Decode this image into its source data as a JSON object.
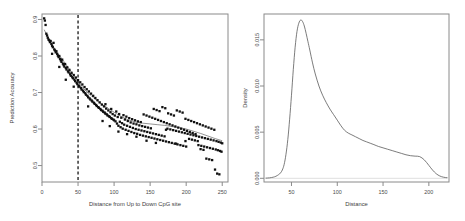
{
  "figure": {
    "panel_count": 2,
    "background": "#ffffff"
  },
  "chart_data": [
    {
      "type": "scatter",
      "title": "",
      "xlabel": "Distance from Up to Down CpG site",
      "ylabel": "Prediction Accuracy",
      "xlim": [
        0,
        258
      ],
      "ylim": [
        0.455,
        0.915
      ],
      "xticks": [
        0,
        50,
        100,
        150,
        200,
        250
      ],
      "xticklabels": [
        "0",
        "50",
        "100",
        "150",
        "200",
        "250"
      ],
      "yticks": [
        0.5,
        0.6,
        0.7,
        0.8,
        0.9
      ],
      "yticklabels": [
        "0.5",
        "0.6",
        "0.7",
        "0.8",
        "0.9"
      ],
      "grid": false,
      "legend": "none",
      "marker": "filled-square",
      "point_color": "#101010",
      "annotations": [
        {
          "name": "vertical-cutoff-line",
          "type": "vline",
          "x": 50,
          "style": "dashed",
          "color": "#000000"
        }
      ],
      "trend_line": {
        "name": "loess-trend",
        "color": "#2a2a2a",
        "x": [
          3,
          10,
          20,
          30,
          40,
          50,
          60,
          70,
          80,
          90,
          100,
          110,
          120,
          130,
          140,
          150,
          160,
          170,
          180,
          190,
          200,
          210,
          220,
          230,
          240,
          250
        ],
        "y": [
          0.872,
          0.845,
          0.812,
          0.786,
          0.758,
          0.729,
          0.706,
          0.688,
          0.672,
          0.659,
          0.646,
          0.634,
          0.625,
          0.619,
          0.616,
          0.614,
          0.612,
          0.61,
          0.607,
          0.604,
          0.6,
          0.594,
          0.588,
          0.581,
          0.574,
          0.568
        ]
      },
      "points": [
        [
          3,
          0.903
        ],
        [
          4,
          0.897
        ],
        [
          5,
          0.885
        ],
        [
          6,
          0.861
        ],
        [
          7,
          0.856
        ],
        [
          8,
          0.85
        ],
        [
          9,
          0.845
        ],
        [
          10,
          0.843
        ],
        [
          11,
          0.838
        ],
        [
          12,
          0.841
        ],
        [
          13,
          0.833
        ],
        [
          14,
          0.828
        ],
        [
          15,
          0.824
        ],
        [
          16,
          0.836
        ],
        [
          17,
          0.818
        ],
        [
          18,
          0.815
        ],
        [
          19,
          0.81
        ],
        [
          20,
          0.813
        ],
        [
          21,
          0.806
        ],
        [
          22,
          0.801
        ],
        [
          23,
          0.797
        ],
        [
          24,
          0.8
        ],
        [
          25,
          0.792
        ],
        [
          26,
          0.788
        ],
        [
          27,
          0.784
        ],
        [
          28,
          0.79
        ],
        [
          29,
          0.779
        ],
        [
          30,
          0.775
        ],
        [
          31,
          0.771
        ],
        [
          32,
          0.778
        ],
        [
          33,
          0.767
        ],
        [
          34,
          0.763
        ],
        [
          35,
          0.769
        ],
        [
          36,
          0.758
        ],
        [
          37,
          0.755
        ],
        [
          38,
          0.762
        ],
        [
          39,
          0.75
        ],
        [
          40,
          0.746
        ],
        [
          41,
          0.754
        ],
        [
          42,
          0.742
        ],
        [
          43,
          0.739
        ],
        [
          44,
          0.748
        ],
        [
          45,
          0.735
        ],
        [
          46,
          0.731
        ],
        [
          47,
          0.741
        ],
        [
          48,
          0.727
        ],
        [
          49,
          0.723
        ],
        [
          50,
          0.734
        ],
        [
          51,
          0.719
        ],
        [
          52,
          0.716
        ],
        [
          53,
          0.728
        ],
        [
          54,
          0.712
        ],
        [
          55,
          0.708
        ],
        [
          56,
          0.722
        ],
        [
          57,
          0.705
        ],
        [
          58,
          0.701
        ],
        [
          59,
          0.715
        ],
        [
          60,
          0.698
        ],
        [
          61,
          0.694
        ],
        [
          62,
          0.709
        ],
        [
          63,
          0.691
        ],
        [
          64,
          0.687
        ],
        [
          65,
          0.703
        ],
        [
          66,
          0.684
        ],
        [
          67,
          0.681
        ],
        [
          68,
          0.697
        ],
        [
          69,
          0.678
        ],
        [
          70,
          0.675
        ],
        [
          71,
          0.691
        ],
        [
          72,
          0.672
        ],
        [
          73,
          0.669
        ],
        [
          74,
          0.685
        ],
        [
          75,
          0.666
        ],
        [
          76,
          0.663
        ],
        [
          77,
          0.679
        ],
        [
          78,
          0.66
        ],
        [
          79,
          0.658
        ],
        [
          80,
          0.673
        ],
        [
          81,
          0.655
        ],
        [
          82,
          0.652
        ],
        [
          83,
          0.667
        ],
        [
          84,
          0.65
        ],
        [
          85,
          0.647
        ],
        [
          86,
          0.662
        ],
        [
          87,
          0.645
        ],
        [
          88,
          0.642
        ],
        [
          89,
          0.656
        ],
        [
          90,
          0.64
        ],
        [
          91,
          0.637
        ],
        [
          92,
          0.651
        ],
        [
          93,
          0.635
        ],
        [
          94,
          0.633
        ],
        [
          95,
          0.646
        ],
        [
          96,
          0.63
        ],
        [
          97,
          0.628
        ],
        [
          98,
          0.641
        ],
        [
          99,
          0.626
        ],
        [
          100,
          0.624
        ],
        [
          33,
          0.735
        ],
        [
          24,
          0.77
        ],
        [
          14,
          0.806
        ],
        [
          44,
          0.716
        ],
        [
          64,
          0.662
        ],
        [
          84,
          0.622
        ],
        [
          94,
          0.608
        ],
        [
          101,
          0.637
        ],
        [
          102,
          0.621
        ],
        [
          103,
          0.648
        ],
        [
          104,
          0.615
        ],
        [
          105,
          0.633
        ],
        [
          106,
          0.609
        ],
        [
          107,
          0.641
        ],
        [
          108,
          0.62
        ],
        [
          109,
          0.605
        ],
        [
          110,
          0.631
        ],
        [
          111,
          0.616
        ],
        [
          112,
          0.601
        ],
        [
          113,
          0.638
        ],
        [
          114,
          0.612
        ],
        [
          115,
          0.626
        ],
        [
          116,
          0.598
        ],
        [
          117,
          0.634
        ],
        [
          118,
          0.609
        ],
        [
          119,
          0.622
        ],
        [
          120,
          0.595
        ],
        [
          121,
          0.63
        ],
        [
          122,
          0.606
        ],
        [
          123,
          0.618
        ],
        [
          124,
          0.592
        ],
        [
          125,
          0.627
        ],
        [
          126,
          0.603
        ],
        [
          127,
          0.615
        ],
        [
          128,
          0.589
        ],
        [
          129,
          0.624
        ],
        [
          130,
          0.6
        ],
        [
          131,
          0.613
        ],
        [
          132,
          0.587
        ],
        [
          133,
          0.621
        ],
        [
          134,
          0.598
        ],
        [
          135,
          0.61
        ],
        [
          136,
          0.584
        ],
        [
          137,
          0.619
        ],
        [
          138,
          0.596
        ],
        [
          139,
          0.608
        ],
        [
          140,
          0.582
        ],
        [
          141,
          0.64
        ],
        [
          142,
          0.594
        ],
        [
          143,
          0.606
        ],
        [
          144,
          0.58
        ],
        [
          145,
          0.637
        ],
        [
          146,
          0.592
        ],
        [
          147,
          0.604
        ],
        [
          148,
          0.578
        ],
        [
          149,
          0.634
        ],
        [
          150,
          0.59
        ],
        [
          151,
          0.602
        ],
        [
          152,
          0.576
        ],
        [
          153,
          0.631
        ],
        [
          154,
          0.588
        ],
        [
          155,
          0.655
        ],
        [
          156,
          0.574
        ],
        [
          157,
          0.628
        ],
        [
          158,
          0.586
        ],
        [
          159,
          0.652
        ],
        [
          160,
          0.572
        ],
        [
          161,
          0.625
        ],
        [
          162,
          0.584
        ],
        [
          163,
          0.649
        ],
        [
          164,
          0.57
        ],
        [
          165,
          0.622
        ],
        [
          166,
          0.582
        ],
        [
          167,
          0.66
        ],
        [
          168,
          0.568
        ],
        [
          169,
          0.619
        ],
        [
          170,
          0.58
        ],
        [
          171,
          0.657
        ],
        [
          172,
          0.566
        ],
        [
          173,
          0.616
        ],
        [
          174,
          0.601
        ],
        [
          175,
          0.643
        ],
        [
          176,
          0.564
        ],
        [
          177,
          0.613
        ],
        [
          178,
          0.599
        ],
        [
          179,
          0.64
        ],
        [
          180,
          0.562
        ],
        [
          181,
          0.61
        ],
        [
          182,
          0.597
        ],
        [
          183,
          0.637
        ],
        [
          184,
          0.56
        ],
        [
          185,
          0.607
        ],
        [
          186,
          0.595
        ],
        [
          187,
          0.651
        ],
        [
          188,
          0.558
        ],
        [
          189,
          0.604
        ],
        [
          190,
          0.593
        ],
        [
          191,
          0.648
        ],
        [
          192,
          0.556
        ],
        [
          193,
          0.601
        ],
        [
          194,
          0.591
        ],
        [
          195,
          0.645
        ],
        [
          196,
          0.554
        ],
        [
          197,
          0.598
        ],
        [
          198,
          0.589
        ],
        [
          199,
          0.628
        ],
        [
          200,
          0.552
        ],
        [
          201,
          0.595
        ],
        [
          202,
          0.587
        ],
        [
          203,
          0.625
        ],
        [
          204,
          0.573
        ],
        [
          205,
          0.592
        ],
        [
          206,
          0.585
        ],
        [
          207,
          0.622
        ],
        [
          208,
          0.571
        ],
        [
          209,
          0.589
        ],
        [
          210,
          0.583
        ],
        [
          211,
          0.619
        ],
        [
          212,
          0.569
        ],
        [
          213,
          0.586
        ],
        [
          214,
          0.581
        ],
        [
          215,
          0.616
        ],
        [
          216,
          0.567
        ],
        [
          217,
          0.556
        ],
        [
          218,
          0.579
        ],
        [
          219,
          0.613
        ],
        [
          220,
          0.545
        ],
        [
          221,
          0.554
        ],
        [
          222,
          0.577
        ],
        [
          223,
          0.61
        ],
        [
          224,
          0.543
        ],
        [
          225,
          0.552
        ],
        [
          226,
          0.575
        ],
        [
          227,
          0.607
        ],
        [
          228,
          0.519
        ],
        [
          229,
          0.55
        ],
        [
          230,
          0.573
        ],
        [
          231,
          0.604
        ],
        [
          232,
          0.517
        ],
        [
          233,
          0.548
        ],
        [
          234,
          0.571
        ],
        [
          235,
          0.601
        ],
        [
          236,
          0.515
        ],
        [
          237,
          0.546
        ],
        [
          238,
          0.569
        ],
        [
          239,
          0.598
        ],
        [
          240,
          0.489
        ],
        [
          241,
          0.544
        ],
        [
          242,
          0.567
        ],
        [
          243,
          0.478
        ],
        [
          244,
          0.542
        ],
        [
          245,
          0.565
        ],
        [
          246,
          0.476
        ],
        [
          247,
          0.54
        ],
        [
          248,
          0.563
        ],
        [
          249,
          0.538
        ],
        [
          250,
          0.561
        ],
        [
          145,
          0.568
        ],
        [
          158,
          0.562
        ],
        [
          172,
          0.598
        ],
        [
          186,
          0.56
        ],
        [
          199,
          0.567
        ],
        [
          118,
          0.586
        ],
        [
          131,
          0.579
        ],
        [
          106,
          0.593
        ],
        [
          96,
          0.655
        ],
        [
          88,
          0.668
        ]
      ]
    },
    {
      "type": "line",
      "subtype": "density",
      "title": "",
      "xlabel": "Distance",
      "ylabel": "Density",
      "xlim": [
        20,
        222
      ],
      "ylim": [
        -0.0004,
        0.0178
      ],
      "xticks": [
        50,
        100,
        150,
        200
      ],
      "xticklabels": [
        "50",
        "100",
        "150",
        "200"
      ],
      "yticks": [
        0.0,
        0.005,
        0.01,
        0.015
      ],
      "yticklabels": [
        "0.000",
        "0.005",
        "0.010",
        "0.015"
      ],
      "grid": false,
      "legend": "none",
      "line_color": "#5a5a5a",
      "x": [
        22,
        26,
        30,
        33,
        36,
        38,
        40,
        42,
        44,
        46,
        48,
        50,
        52,
        54,
        56,
        58,
        60,
        62,
        64,
        66,
        68,
        70,
        73,
        76,
        80,
        84,
        88,
        92,
        96,
        100,
        104,
        108,
        112,
        116,
        120,
        124,
        128,
        132,
        136,
        140,
        145,
        150,
        155,
        160,
        165,
        170,
        175,
        180,
        185,
        190,
        195,
        200,
        204,
        208,
        212,
        216,
        220
      ],
      "y": [
        2e-05,
        5e-05,
        0.00012,
        0.00022,
        0.0004,
        0.00058,
        0.0009,
        0.0015,
        0.0026,
        0.0042,
        0.0064,
        0.009,
        0.0118,
        0.0142,
        0.0159,
        0.0168,
        0.01715,
        0.017,
        0.0165,
        0.0157,
        0.0148,
        0.0139,
        0.0125,
        0.0113,
        0.01,
        0.009,
        0.0082,
        0.0075,
        0.0069,
        0.0063,
        0.0057,
        0.0052,
        0.0049,
        0.0047,
        0.0045,
        0.0043,
        0.0041,
        0.00395,
        0.0038,
        0.00365,
        0.00345,
        0.0033,
        0.00315,
        0.003,
        0.00285,
        0.0027,
        0.00255,
        0.00245,
        0.0024,
        0.00235,
        0.002,
        0.0014,
        0.0009,
        0.0005,
        0.00025,
        0.00012,
        6e-05
      ]
    }
  ]
}
